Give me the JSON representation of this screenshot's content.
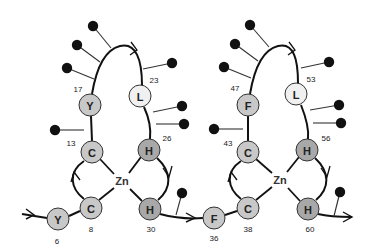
{
  "colors": {
    "residue_light": "#f0f0f0",
    "residue_mid": "#c8c8c8",
    "residue_dark": "#a8a8a8",
    "ball": "#111111",
    "line": "#111111"
  },
  "fingers": [
    {
      "id": "finger-1",
      "zn": {
        "label": "Zn",
        "x": 122,
        "y": 181
      },
      "residues": [
        {
          "letter": "Y",
          "pos": "6",
          "x": 58,
          "y": 219,
          "r": 11,
          "shade": "mid",
          "lx": 57,
          "ly": 241
        },
        {
          "letter": "C",
          "pos": "8",
          "x": 91,
          "y": 208,
          "r": 11,
          "shade": "mid",
          "lx": 91,
          "ly": 229
        },
        {
          "letter": "C",
          "pos": "13",
          "x": 92,
          "y": 152,
          "r": 11,
          "shade": "mid",
          "lx": 71,
          "ly": 143
        },
        {
          "letter": "Y",
          "pos": "17",
          "x": 90,
          "y": 105,
          "r": 11,
          "shade": "mid",
          "lx": 78,
          "ly": 89
        },
        {
          "letter": "L",
          "pos": "23",
          "x": 140,
          "y": 96,
          "r": 11,
          "shade": "light",
          "lx": 154,
          "ly": 80
        },
        {
          "letter": "H",
          "pos": "26",
          "x": 149,
          "y": 150,
          "r": 11,
          "shade": "dark",
          "lx": 167,
          "ly": 138
        },
        {
          "letter": "H",
          "pos": "30",
          "x": 150,
          "y": 209,
          "r": 11,
          "shade": "dark",
          "lx": 151,
          "ly": 229
        }
      ],
      "balls": [
        {
          "x": 93,
          "y": 26,
          "sx": 111,
          "sy": 48
        },
        {
          "x": 77,
          "y": 45,
          "sx": 100,
          "sy": 62
        },
        {
          "x": 67,
          "y": 68,
          "sx": 94,
          "sy": 79
        },
        {
          "x": 172,
          "y": 63,
          "sx": 143,
          "sy": 69
        },
        {
          "x": 182,
          "y": 106,
          "sx": 153,
          "sy": 112
        },
        {
          "x": 184,
          "y": 124,
          "sx": 156,
          "sy": 124
        },
        {
          "x": 55,
          "y": 130,
          "sx": 84,
          "sy": 130
        },
        {
          "x": 182,
          "y": 193,
          "sx": 176,
          "sy": 215
        }
      ]
    },
    {
      "id": "finger-2",
      "zn": {
        "label": "Zn",
        "x": 280,
        "y": 180
      },
      "residues": [
        {
          "letter": "F",
          "pos": "36",
          "x": 214,
          "y": 218,
          "r": 11,
          "shade": "mid",
          "lx": 214,
          "ly": 238
        },
        {
          "letter": "C",
          "pos": "38",
          "x": 248,
          "y": 208,
          "r": 11,
          "shade": "mid",
          "lx": 248,
          "ly": 229
        },
        {
          "letter": "C",
          "pos": "43",
          "x": 248,
          "y": 152,
          "r": 11,
          "shade": "mid",
          "lx": 228,
          "ly": 143
        },
        {
          "letter": "F",
          "pos": "47",
          "x": 248,
          "y": 105,
          "r": 11,
          "shade": "mid",
          "lx": 235,
          "ly": 88
        },
        {
          "letter": "L",
          "pos": "53",
          "x": 296,
          "y": 94,
          "r": 11,
          "shade": "light",
          "lx": 311,
          "ly": 79
        },
        {
          "letter": "H",
          "pos": "56",
          "x": 307,
          "y": 150,
          "r": 11,
          "shade": "dark",
          "lx": 326,
          "ly": 138
        },
        {
          "letter": "H",
          "pos": "60",
          "x": 308,
          "y": 209,
          "r": 11,
          "shade": "dark",
          "lx": 310,
          "ly": 229
        }
      ],
      "balls": [
        {
          "x": 250,
          "y": 25,
          "sx": 269,
          "sy": 47
        },
        {
          "x": 235,
          "y": 44,
          "sx": 258,
          "sy": 61
        },
        {
          "x": 224,
          "y": 67,
          "sx": 251,
          "sy": 78
        },
        {
          "x": 329,
          "y": 62,
          "sx": 301,
          "sy": 68
        },
        {
          "x": 339,
          "y": 105,
          "sx": 310,
          "sy": 110
        },
        {
          "x": 341,
          "y": 123,
          "sx": 313,
          "sy": 123
        },
        {
          "x": 214,
          "y": 129,
          "sx": 243,
          "sy": 129
        },
        {
          "x": 340,
          "y": 192,
          "sx": 334,
          "sy": 216
        }
      ]
    }
  ]
}
